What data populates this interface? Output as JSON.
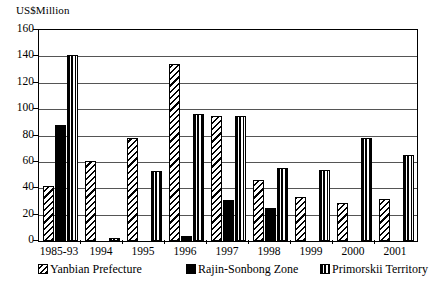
{
  "chart_data": {
    "type": "bar",
    "title": "",
    "ylabel": "US$Million",
    "xlabel": "",
    "ylim": [
      0,
      160
    ],
    "yticks": [
      0,
      20,
      40,
      60,
      80,
      100,
      120,
      140,
      160
    ],
    "grid": true,
    "legend_position": "bottom",
    "categories": [
      "1985-93",
      "1994",
      "1995",
      "1996",
      "1997",
      "1998",
      "1999",
      "2000",
      "2001"
    ],
    "series": [
      {
        "name": "Yanbian Prefecture",
        "pattern": "diagonal-hatch",
        "color": "#000000",
        "values": [
          42,
          61,
          78,
          134,
          95,
          46,
          33,
          29,
          32
        ]
      },
      {
        "name": "Rajin-Sonbong Zone",
        "pattern": "solid",
        "color": "#000000",
        "values": [
          88,
          0,
          0,
          4,
          31,
          25,
          0,
          0,
          0
        ]
      },
      {
        "name": "Primorskii Territory",
        "pattern": "vertical-stripe",
        "color": "#000000",
        "values": [
          141,
          2,
          53,
          96,
          95,
          55,
          54,
          78,
          65
        ]
      }
    ]
  },
  "legend": {
    "items": [
      {
        "label": "Yanbian Prefecture",
        "swatch": "yanbian-swatch-icon"
      },
      {
        "label": "Rajin-Sonbong Zone",
        "swatch": "rajin-swatch-icon"
      },
      {
        "label": "Primorskii Territory",
        "swatch": "primorskii-swatch-icon"
      }
    ]
  }
}
